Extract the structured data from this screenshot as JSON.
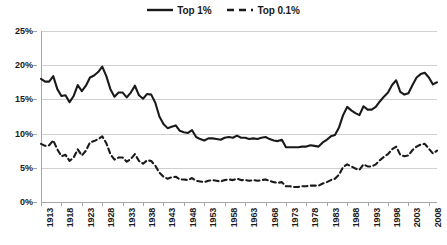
{
  "legend": {
    "position": "top-center",
    "entries": [
      {
        "label": "Top 1%",
        "style": "solid",
        "color": "#1a1a1a",
        "icon": "solid-line-swatch"
      },
      {
        "label": "Top 0.1%",
        "style": "dashed",
        "color": "#1a1a1a",
        "icon": "dashed-line-swatch"
      }
    ]
  },
  "axes": {
    "y_ticks": [
      "0%",
      "5%",
      "10%",
      "15%",
      "20%",
      "25%"
    ],
    "x_ticks": [
      "1913",
      "1918",
      "1923",
      "1928",
      "1933",
      "1938",
      "1943",
      "1948",
      "1953",
      "1958",
      "1963",
      "1968",
      "1973",
      "1978",
      "1983",
      "1988",
      "1993",
      "1998",
      "2003",
      "2008"
    ]
  },
  "chart_data": {
    "type": "line",
    "title": "",
    "subtitle": "",
    "xlabel": "",
    "ylabel": "",
    "xlim": [
      1913,
      2010
    ],
    "ylim": [
      0,
      25
    ],
    "ytick_values": [
      0,
      5,
      10,
      15,
      20,
      25
    ],
    "ytick_labels": [
      "0%",
      "5%",
      "10%",
      "15%",
      "20%",
      "25%"
    ],
    "xtick_values": [
      1913,
      1918,
      1923,
      1928,
      1933,
      1938,
      1943,
      1948,
      1953,
      1958,
      1963,
      1968,
      1973,
      1978,
      1983,
      1988,
      1993,
      1998,
      2003,
      2008
    ],
    "xtick_labels": [
      "1913",
      "1918",
      "1923",
      "1928",
      "1933",
      "1938",
      "1943",
      "1948",
      "1953",
      "1958",
      "1963",
      "1968",
      "1973",
      "1978",
      "1983",
      "1988",
      "1993",
      "1998",
      "2003",
      "2008"
    ],
    "xtick_rotation": 90,
    "grid": "horizontal",
    "legend_position": "top-center",
    "units": "percent",
    "x": [
      1913,
      1914,
      1915,
      1916,
      1917,
      1918,
      1919,
      1920,
      1921,
      1922,
      1923,
      1924,
      1925,
      1926,
      1927,
      1928,
      1929,
      1930,
      1931,
      1932,
      1933,
      1934,
      1935,
      1936,
      1937,
      1938,
      1939,
      1940,
      1941,
      1942,
      1943,
      1944,
      1945,
      1946,
      1947,
      1948,
      1949,
      1950,
      1951,
      1952,
      1953,
      1954,
      1955,
      1956,
      1957,
      1958,
      1959,
      1960,
      1961,
      1962,
      1963,
      1964,
      1965,
      1966,
      1967,
      1968,
      1969,
      1970,
      1971,
      1972,
      1973,
      1974,
      1975,
      1976,
      1977,
      1978,
      1979,
      1980,
      1981,
      1982,
      1983,
      1984,
      1985,
      1986,
      1987,
      1988,
      1989,
      1990,
      1991,
      1992,
      1993,
      1994,
      1995,
      1996,
      1997,
      1998,
      1999,
      2000,
      2001,
      2002,
      2003,
      2004,
      2005,
      2006,
      2007,
      2008,
      2009,
      2010
    ],
    "series": [
      {
        "name": "Top 1%",
        "style": "solid",
        "color": "#1a1a1a",
        "values": [
          18.0,
          17.6,
          17.6,
          18.4,
          16.5,
          15.5,
          15.6,
          14.6,
          15.5,
          17.1,
          16.2,
          17.0,
          18.2,
          18.5,
          19.0,
          19.8,
          18.4,
          16.5,
          15.4,
          16.0,
          16.0,
          15.3,
          16.0,
          17.0,
          15.6,
          15.1,
          15.8,
          15.7,
          14.5,
          12.5,
          11.4,
          10.8,
          11.0,
          11.2,
          10.4,
          10.2,
          10.1,
          10.5,
          9.5,
          9.2,
          9.0,
          9.3,
          9.3,
          9.2,
          9.1,
          9.4,
          9.5,
          9.4,
          9.7,
          9.4,
          9.4,
          9.2,
          9.3,
          9.2,
          9.4,
          9.5,
          9.2,
          9.0,
          8.9,
          9.1,
          8.0,
          8.0,
          8.0,
          8.0,
          8.1,
          8.1,
          8.3,
          8.2,
          8.1,
          8.7,
          9.1,
          9.6,
          9.8,
          10.9,
          12.7,
          13.9,
          13.4,
          13.0,
          12.7,
          14.0,
          13.5,
          13.5,
          13.9,
          14.7,
          15.4,
          16.0,
          17.1,
          17.8,
          16.1,
          15.7,
          15.9,
          17.1,
          18.2,
          18.7,
          18.9,
          18.2,
          17.2,
          17.5
        ]
      },
      {
        "name": "Top 0.1%",
        "style": "dashed",
        "color": "#1a1a1a",
        "values": [
          8.5,
          8.2,
          8.3,
          9.0,
          7.7,
          6.7,
          6.9,
          6.0,
          6.5,
          7.7,
          6.8,
          7.5,
          8.7,
          8.9,
          9.2,
          9.6,
          8.6,
          7.0,
          6.2,
          6.5,
          6.5,
          5.9,
          6.3,
          7.0,
          6.0,
          5.6,
          6.1,
          6.0,
          5.3,
          4.3,
          3.7,
          3.4,
          3.6,
          3.7,
          3.3,
          3.3,
          3.2,
          3.5,
          3.1,
          3.0,
          2.9,
          3.1,
          3.2,
          3.1,
          3.0,
          3.2,
          3.3,
          3.2,
          3.4,
          3.2,
          3.2,
          3.1,
          3.2,
          3.1,
          3.2,
          3.3,
          3.1,
          2.9,
          2.8,
          2.9,
          2.3,
          2.3,
          2.2,
          2.2,
          2.3,
          2.3,
          2.4,
          2.4,
          2.4,
          2.7,
          2.9,
          3.2,
          3.4,
          4.0,
          5.1,
          5.5,
          5.2,
          4.9,
          4.7,
          5.5,
          5.2,
          5.2,
          5.5,
          6.1,
          6.6,
          7.0,
          7.7,
          8.1,
          6.9,
          6.7,
          6.8,
          7.6,
          8.1,
          8.4,
          8.5,
          7.8,
          7.1,
          7.5
        ]
      }
    ]
  }
}
